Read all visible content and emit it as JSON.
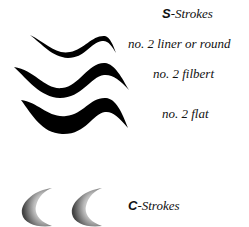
{
  "s_strokes": {
    "heading_letter": "S",
    "heading_rest": "-Strokes",
    "items": [
      {
        "label": "no. 2 liner or round"
      },
      {
        "label": "no. 2 filbert"
      },
      {
        "label": "no. 2 flat"
      }
    ]
  },
  "c_strokes": {
    "heading_letter": "C",
    "heading_rest": "-Strokes"
  }
}
